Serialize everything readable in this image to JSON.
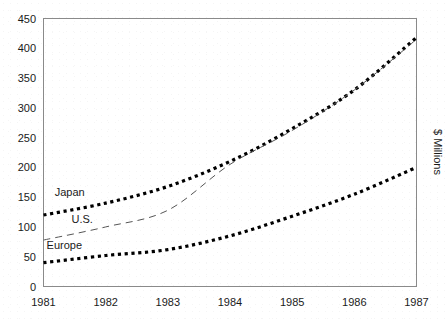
{
  "chart_data": {
    "type": "line",
    "title": "",
    "xlabel": "",
    "ylabel": "$ Millions",
    "x": [
      1981,
      1982,
      1983,
      1984,
      1985,
      1986,
      1987
    ],
    "xtick_labels": [
      "1981",
      "1982",
      "1983",
      "1984",
      "1985",
      "1986",
      "1987"
    ],
    "ytick_labels": [
      "0",
      "50",
      "100",
      "150",
      "200",
      "250",
      "300",
      "350",
      "400",
      "450"
    ],
    "ytick_values": [
      0,
      50,
      100,
      150,
      200,
      250,
      300,
      350,
      400,
      450
    ],
    "xlim": [
      1981,
      1987
    ],
    "ylim": [
      0,
      450
    ],
    "grid": false,
    "legend_position": "inline-labels",
    "series": [
      {
        "name": "Japan",
        "style": "dotted",
        "color": "#000000",
        "values": [
          120,
          140,
          168,
          210,
          265,
          330,
          418
        ],
        "label_x": 1981.18,
        "label_y": 152
      },
      {
        "name": "U.S.",
        "style": "dashed",
        "color": "#555555",
        "values": [
          78,
          100,
          128,
          205,
          262,
          330,
          415
        ],
        "label_x": 1981.45,
        "label_y": 106
      },
      {
        "name": "Europe",
        "style": "dotted",
        "color": "#000000",
        "values": [
          40,
          52,
          62,
          85,
          118,
          155,
          200
        ],
        "label_x": 1981.05,
        "label_y": 63
      }
    ]
  }
}
